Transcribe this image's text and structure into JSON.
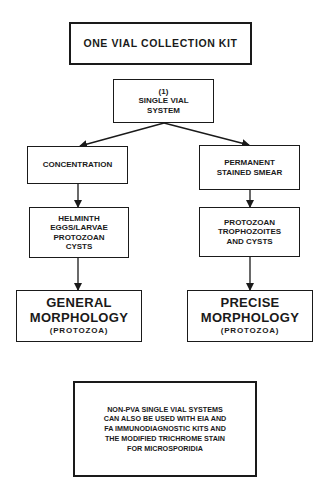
{
  "diagram": {
    "title_box": {
      "label": "ONE VIAL COLLECTION KIT"
    },
    "system_box": {
      "lines": [
        "(1)",
        "SINGLE VIAL",
        "SYSTEM"
      ]
    },
    "left_branch": {
      "method": {
        "lines": [
          "CONCENTRATION"
        ]
      },
      "finds": {
        "lines": [
          "HELMINTH",
          "EGGS/LARVAE",
          "PROTOZOAN",
          "CYSTS"
        ]
      },
      "result": {
        "lines": [
          "GENERAL",
          "MORPHOLOGY",
          "(PROTOZOA)"
        ]
      }
    },
    "right_branch": {
      "method": {
        "lines": [
          "PERMANENT",
          "STAINED SMEAR"
        ]
      },
      "finds": {
        "lines": [
          "PROTOZOAN",
          "TROPHOZOITES",
          "AND CYSTS"
        ]
      },
      "result": {
        "lines": [
          "PRECISE",
          "MORPHOLOGY",
          "(PROTOZOA)"
        ]
      }
    },
    "note_box": {
      "lines": [
        "NON-PVA SINGLE VIAL SYSTEMS",
        "CAN ALSO BE USED WITH EIA AND",
        "FA IMMUNODIAGNOSTIC KITS AND",
        "THE MODIFIED TRICHROME STAIN",
        "FOR MICROSPORIDIA"
      ]
    },
    "colors": {
      "ink": "#1a1a1a",
      "background": "#ffffff"
    }
  }
}
